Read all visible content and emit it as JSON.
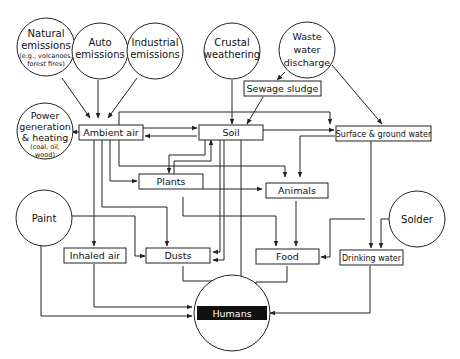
{
  "diagram": {
    "type": "flowchart",
    "title": "",
    "sources": {
      "natural": {
        "lines": [
          "Natural",
          "emissions",
          "(e.g., volcanoes,",
          "forest fires)"
        ]
      },
      "auto": {
        "lines": [
          "Auto",
          "emissions"
        ]
      },
      "industrial": {
        "lines": [
          "Industrial",
          "emissions"
        ]
      },
      "crustal": {
        "lines": [
          "Crustal",
          "weathering"
        ]
      },
      "waste": {
        "lines": [
          "Waste",
          "water",
          "discharge"
        ]
      },
      "power": {
        "lines": [
          "Power",
          "generation",
          "& heating",
          "(coal, oil,",
          "wood)"
        ]
      },
      "paint": {
        "lines": [
          "Paint"
        ]
      },
      "solder": {
        "lines": [
          "Solder"
        ]
      }
    },
    "nodes": {
      "sewage": "Sewage sludge",
      "ambient_air": "Ambient air",
      "soil": "Soil",
      "surface_water": "Surface & ground water",
      "plants": "Plants",
      "animals": "Animals",
      "inhaled_air": "Inhaled air",
      "dusts": "Dusts",
      "food": "Food",
      "drinking_water": "Drinking water",
      "humans": "Humans"
    },
    "edges": [
      {
        "from": "Natural emissions",
        "to": "Ambient air"
      },
      {
        "from": "Auto emissions",
        "to": "Ambient air"
      },
      {
        "from": "Industrial emissions",
        "to": "Ambient air"
      },
      {
        "from": "Power generation & heating",
        "to": "Ambient air"
      },
      {
        "from": "Crustal weathering",
        "to": "Soil"
      },
      {
        "from": "Waste water discharge",
        "to": "Sewage sludge"
      },
      {
        "from": "Waste water discharge",
        "to": "Surface & ground water"
      },
      {
        "from": "Sewage sludge",
        "to": "Soil"
      },
      {
        "from": "Ambient air",
        "to": "Soil"
      },
      {
        "from": "Soil",
        "to": "Ambient air"
      },
      {
        "from": "Ambient air",
        "to": "Surface & ground water"
      },
      {
        "from": "Soil",
        "to": "Surface & ground water"
      },
      {
        "from": "Soil",
        "to": "Plants"
      },
      {
        "from": "Plants",
        "to": "Soil"
      },
      {
        "from": "Ambient air",
        "to": "Plants"
      },
      {
        "from": "Ambient air",
        "to": "Animals"
      },
      {
        "from": "Plants",
        "to": "Animals"
      },
      {
        "from": "Surface & ground water",
        "to": "Animals"
      },
      {
        "from": "Ambient air",
        "to": "Inhaled air"
      },
      {
        "from": "Ambient air",
        "to": "Dusts"
      },
      {
        "from": "Soil",
        "to": "Dusts"
      },
      {
        "from": "Plants",
        "to": "Food"
      },
      {
        "from": "Animals",
        "to": "Food"
      },
      {
        "from": "Paint",
        "to": "Dusts"
      },
      {
        "from": "Paint",
        "to": "Humans"
      },
      {
        "from": "Solder",
        "to": "Food"
      },
      {
        "from": "Solder",
        "to": "Drinking water"
      },
      {
        "from": "Surface & ground water",
        "to": "Drinking water"
      },
      {
        "from": "Inhaled air",
        "to": "Humans"
      },
      {
        "from": "Dusts",
        "to": "Humans"
      },
      {
        "from": "Soil",
        "to": "Humans"
      },
      {
        "from": "Food",
        "to": "Humans"
      },
      {
        "from": "Drinking water",
        "to": "Humans"
      }
    ]
  }
}
